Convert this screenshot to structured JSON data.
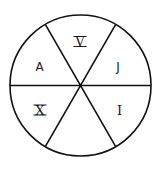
{
  "diagram": {
    "shape": "circle divided into 6 equal sectors",
    "stroke_color": "#111111",
    "background": "#ffffff",
    "sectors": [
      {
        "position": "top",
        "label": "V"
      },
      {
        "position": "upper-right",
        "label": "J"
      },
      {
        "position": "lower-right",
        "label": "I"
      },
      {
        "position": "bottom",
        "label": ""
      },
      {
        "position": "lower-left",
        "label": "X"
      },
      {
        "position": "upper-left",
        "label": "A"
      }
    ]
  }
}
